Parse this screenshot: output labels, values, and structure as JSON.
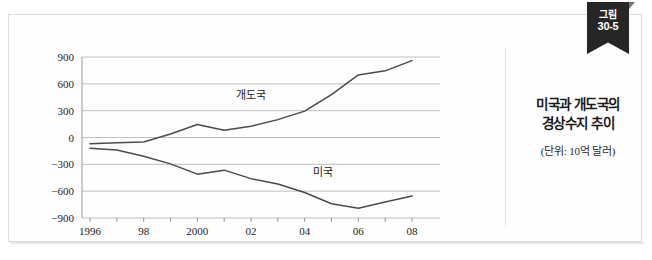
{
  "ribbon": {
    "line1": "그림",
    "line2": "30-5"
  },
  "caption": {
    "title_line1": "미국과 개도국의",
    "title_line2": "경상수지 추이",
    "unit_note": "(단위: 10억 달러)"
  },
  "colors": {
    "line": "#4a4a4a",
    "grid": "#b9b9b9",
    "axis": "#8a8a8a",
    "ribbon_bg": "#262626",
    "text": "#1a1a1a",
    "panel_bg": "#fefefe",
    "frame": "#dcdcdc"
  },
  "chart_data": {
    "type": "line",
    "title": "미국과 개도국의 경상수지 추이",
    "subtitle": "(단위: 10억 달러)",
    "xlabel": "",
    "ylabel": "",
    "unit": "10억 달러",
    "grid": true,
    "legend": "inline-labels",
    "ylim": [
      -900,
      900
    ],
    "yticks": [
      900,
      600,
      300,
      0,
      -300,
      -600,
      -900
    ],
    "ytick_labels": [
      "900",
      "600",
      "300",
      "0",
      "−300",
      "−600",
      "−900"
    ],
    "x": [
      1996,
      1997,
      1998,
      1999,
      2000,
      2001,
      2002,
      2003,
      2004,
      2005,
      2006,
      2007,
      2008
    ],
    "xticks": [
      1996,
      1997,
      1998,
      1999,
      2000,
      2001,
      2002,
      2003,
      2004,
      2005,
      2006,
      2007,
      2008
    ],
    "xtick_labels": [
      "1996",
      "",
      "98",
      "",
      "2000",
      "",
      "02",
      "",
      "04",
      "",
      "06",
      "",
      "08"
    ],
    "series": [
      {
        "name": "개도국",
        "label_x": 2002,
        "label_y": 430,
        "values": [
          -70,
          -60,
          -50,
          40,
          145,
          80,
          125,
          200,
          295,
          480,
          700,
          745,
          860
        ]
      },
      {
        "name": "미국",
        "label_x": 2004.7,
        "label_y": -430,
        "values": [
          -120,
          -140,
          -210,
          -295,
          -410,
          -365,
          -460,
          -520,
          -615,
          -740,
          -790,
          -720,
          -655
        ]
      }
    ]
  }
}
